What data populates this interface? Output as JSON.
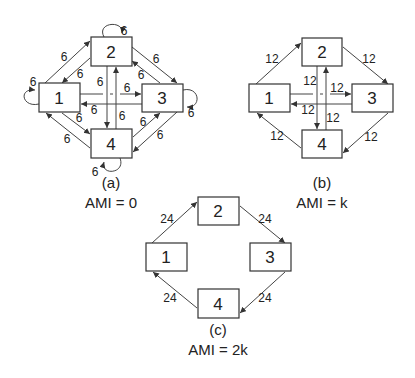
{
  "diagrams": [
    {
      "id": "a",
      "caption": "(a)",
      "ami": "AMI = 0",
      "nodes": [
        "1",
        "2",
        "3",
        "4"
      ],
      "weight": "6",
      "edges": [
        {
          "from": "1",
          "to": "2",
          "w": "6"
        },
        {
          "from": "2",
          "to": "1",
          "w": "6"
        },
        {
          "from": "2",
          "to": "3",
          "w": "6"
        },
        {
          "from": "3",
          "to": "2",
          "w": "6"
        },
        {
          "from": "3",
          "to": "4",
          "w": "6"
        },
        {
          "from": "4",
          "to": "3",
          "w": "6"
        },
        {
          "from": "4",
          "to": "1",
          "w": "6"
        },
        {
          "from": "1",
          "to": "4",
          "w": "6"
        },
        {
          "from": "1",
          "to": "3",
          "w": "6"
        },
        {
          "from": "3",
          "to": "1",
          "w": "6"
        },
        {
          "from": "2",
          "to": "4",
          "w": "6"
        },
        {
          "from": "4",
          "to": "2",
          "w": "6"
        },
        {
          "from": "1",
          "to": "1",
          "w": "6"
        },
        {
          "from": "2",
          "to": "2",
          "w": "6"
        },
        {
          "from": "3",
          "to": "3",
          "w": "6"
        },
        {
          "from": "4",
          "to": "4",
          "w": "6"
        }
      ]
    },
    {
      "id": "b",
      "caption": "(b)",
      "ami": "AMI = k",
      "nodes": [
        "1",
        "2",
        "3",
        "4"
      ],
      "weight": "12",
      "edges": [
        {
          "from": "1",
          "to": "2",
          "w": "12"
        },
        {
          "from": "2",
          "to": "3",
          "w": "12"
        },
        {
          "from": "3",
          "to": "4",
          "w": "12"
        },
        {
          "from": "4",
          "to": "1",
          "w": "12"
        },
        {
          "from": "1",
          "to": "3",
          "w": "12"
        },
        {
          "from": "3",
          "to": "1",
          "w": "12"
        },
        {
          "from": "2",
          "to": "4",
          "w": "12"
        },
        {
          "from": "4",
          "to": "2",
          "w": "12"
        }
      ]
    },
    {
      "id": "c",
      "caption": "(c)",
      "ami": "AMI = 2k",
      "nodes": [
        "1",
        "2",
        "3",
        "4"
      ],
      "weight": "24",
      "edges": [
        {
          "from": "1",
          "to": "2",
          "w": "24"
        },
        {
          "from": "2",
          "to": "3",
          "w": "24"
        },
        {
          "from": "3",
          "to": "4",
          "w": "24"
        },
        {
          "from": "4",
          "to": "1",
          "w": "24"
        }
      ]
    }
  ]
}
